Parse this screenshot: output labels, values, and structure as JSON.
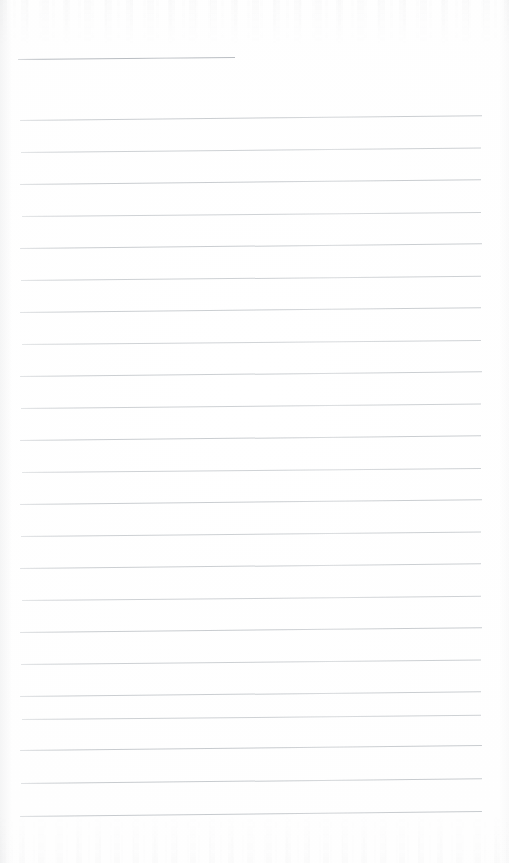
{
  "document": {
    "kind": "scanned-lined-paper",
    "title": "",
    "body_text": "",
    "page_width": 509,
    "page_height": 863,
    "background_color": "#fefefe",
    "rule_color": "#c2c6ca",
    "header_rule_color": "#b9bdc2",
    "is_blank": true,
    "visible_text_content": []
  },
  "header_rule": {
    "label": "",
    "x": 18,
    "y": 59,
    "width": 217,
    "tilt_deg": -0.5
  },
  "ruling": {
    "line_count": 22,
    "first_line_y": 120,
    "line_spacing": 31.8,
    "left_margin_x": 20,
    "right_edge_x": 482,
    "line_thickness": 1,
    "tilt_deg": -0.55,
    "lines": [
      {
        "index": 1,
        "y": 120,
        "x": 20,
        "width": 462,
        "tilt_deg": -0.6,
        "opacity": 0.85
      },
      {
        "index": 2,
        "y": 152,
        "x": 21,
        "width": 460,
        "tilt_deg": -0.55,
        "opacity": 0.8
      },
      {
        "index": 3,
        "y": 184,
        "x": 20,
        "width": 461,
        "tilt_deg": -0.6,
        "opacity": 0.88
      },
      {
        "index": 4,
        "y": 216,
        "x": 22,
        "width": 459,
        "tilt_deg": -0.5,
        "opacity": 0.78
      },
      {
        "index": 5,
        "y": 248,
        "x": 20,
        "width": 462,
        "tilt_deg": -0.58,
        "opacity": 0.86
      },
      {
        "index": 6,
        "y": 280,
        "x": 21,
        "width": 460,
        "tilt_deg": -0.52,
        "opacity": 0.8
      },
      {
        "index": 7,
        "y": 312,
        "x": 20,
        "width": 461,
        "tilt_deg": -0.6,
        "opacity": 0.84
      },
      {
        "index": 8,
        "y": 344,
        "x": 22,
        "width": 459,
        "tilt_deg": -0.5,
        "opacity": 0.76
      },
      {
        "index": 9,
        "y": 376,
        "x": 20,
        "width": 462,
        "tilt_deg": -0.58,
        "opacity": 0.84
      },
      {
        "index": 10,
        "y": 408,
        "x": 21,
        "width": 460,
        "tilt_deg": -0.55,
        "opacity": 0.8
      },
      {
        "index": 11,
        "y": 440,
        "x": 20,
        "width": 461,
        "tilt_deg": -0.58,
        "opacity": 0.86
      },
      {
        "index": 12,
        "y": 472,
        "x": 22,
        "width": 459,
        "tilt_deg": -0.5,
        "opacity": 0.78
      },
      {
        "index": 13,
        "y": 504,
        "x": 20,
        "width": 462,
        "tilt_deg": -0.6,
        "opacity": 0.86
      },
      {
        "index": 14,
        "y": 536,
        "x": 21,
        "width": 460,
        "tilt_deg": -0.55,
        "opacity": 0.82
      },
      {
        "index": 15,
        "y": 568,
        "x": 20,
        "width": 461,
        "tilt_deg": -0.58,
        "opacity": 0.84
      },
      {
        "index": 16,
        "y": 600,
        "x": 22,
        "width": 459,
        "tilt_deg": -0.52,
        "opacity": 0.78
      },
      {
        "index": 17,
        "y": 632,
        "x": 20,
        "width": 462,
        "tilt_deg": -0.6,
        "opacity": 0.88
      },
      {
        "index": 18,
        "y": 664,
        "x": 21,
        "width": 460,
        "tilt_deg": -0.55,
        "opacity": 0.82
      },
      {
        "index": 19,
        "y": 696,
        "x": 20,
        "width": 461,
        "tilt_deg": -0.58,
        "opacity": 0.86
      },
      {
        "index": 20,
        "y": 719,
        "x": 22,
        "width": 459,
        "tilt_deg": -0.52,
        "opacity": 0.8
      },
      {
        "index": 21,
        "y": 750,
        "x": 20,
        "width": 462,
        "tilt_deg": -0.62,
        "opacity": 0.9
      },
      {
        "index": 22,
        "y": 783,
        "x": 21,
        "width": 461,
        "tilt_deg": -0.58,
        "opacity": 0.9
      },
      {
        "index": 23,
        "y": 816,
        "x": 20,
        "width": 462,
        "tilt_deg": -0.62,
        "opacity": 0.92
      }
    ]
  },
  "artifacts": {
    "top_ghosting": true,
    "bottom_ghosting": true,
    "left_edge_shadow": true,
    "right_edge_shadow": true
  }
}
